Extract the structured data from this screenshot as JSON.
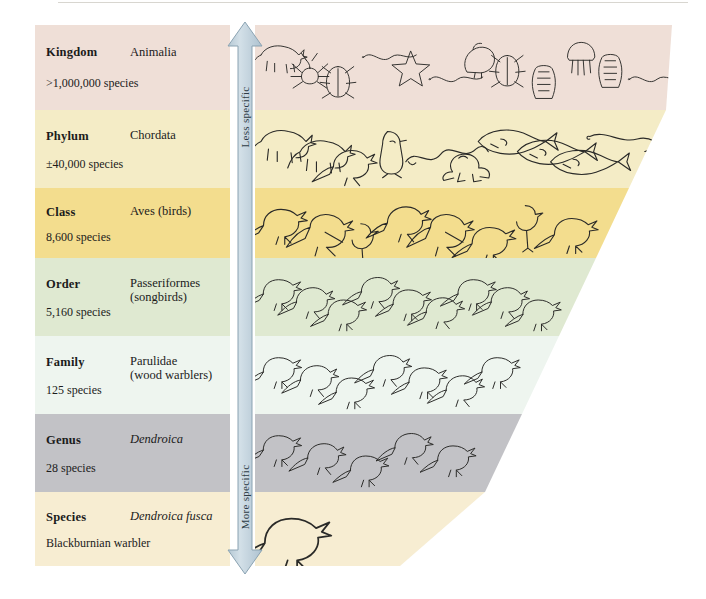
{
  "figure": {
    "background": "#ffffff"
  },
  "arrow": {
    "top_label": "Less specific",
    "bottom_label": "More specific",
    "color": "#c3d2dc",
    "stroke": "#8fa6b4",
    "direction": "double-headed-vertical"
  },
  "ranks": [
    {
      "rank": "Kingdom",
      "taxon": "Animalia",
      "italic": false,
      "count": ">1,000,000 species",
      "band_color": "#efdfd7",
      "top": 25,
      "bottom": 110,
      "right_edge_top": 672,
      "right_edge_bottom": 666,
      "illustrations": "assorted animal phyla: elephant, spider, beetle, starfish, worms, mollusc, sponge, jellyfish, tunicate"
    },
    {
      "rank": "Phylum",
      "taxon": "Chordata",
      "italic": false,
      "count": "±40,000 species",
      "band_color": "#f4ecc6",
      "top": 110,
      "bottom": 188,
      "right_edge_top": 666,
      "right_edge_bottom": 629,
      "illustrations": "hedgehog, tiger, owl, penguin, snake, frog, flounder, trout, shark, lamprey"
    },
    {
      "rank": "Class",
      "taxon": "Aves (birds)",
      "italic": false,
      "count": "8,600 species",
      "band_color": "#f3dd8e",
      "top": 188,
      "bottom": 258,
      "right_edge_top": 629,
      "right_edge_bottom": 596,
      "illustrations": "woodpecker, parrot, flamingo, puffin, eagle, turkey, ostrich, cardinal"
    },
    {
      "rank": "Order",
      "taxon": "Passeriformes\n(songbirds)",
      "italic": false,
      "count": "5,160 species",
      "band_color": "#dfe9d1",
      "top": 258,
      "bottom": 336,
      "right_edge_top": 596,
      "right_edge_bottom": 559,
      "illustrations": "sparrow, swallow, thrush, crow, wren, finch, jay, starling"
    },
    {
      "rank": "Family",
      "taxon": "Parulidae\n(wood warblers)",
      "italic": false,
      "count": "125 species",
      "band_color": "#eef5ef",
      "top": 336,
      "bottom": 414,
      "right_edge_top": 559,
      "right_edge_bottom": 522,
      "illustrations": "assorted wood warblers"
    },
    {
      "rank": "Genus",
      "taxon": "Dendroica",
      "italic": true,
      "count": "28 species",
      "band_color": "#c2c2c6",
      "top": 414,
      "bottom": 492,
      "right_edge_top": 522,
      "right_edge_bottom": 485,
      "illustrations": "Dendroica warblers"
    },
    {
      "rank": "Species",
      "taxon": "Dendroica fusca",
      "italic": true,
      "count": "Blackburnian warbler",
      "band_color": "#f7edd2",
      "top": 492,
      "bottom": 566,
      "right_edge_top": 485,
      "right_edge_bottom": 400,
      "illustrations": "single Blackburnian warbler"
    }
  ]
}
